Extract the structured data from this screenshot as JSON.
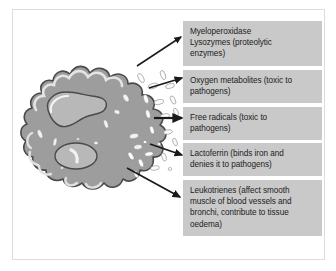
{
  "figure": {
    "border_color": "#dcdcdc",
    "background_color": "#ffffff"
  },
  "cell": {
    "name": "neutrophil",
    "body_color": "#9d9d9d",
    "outline_color": "#4d4d4d",
    "nucleus_color": "#b5b5b5",
    "granule_color": "#f2f2f2",
    "highlight_color": "#e8e8e8"
  },
  "arrows": {
    "color": "#1a1a1a",
    "count": 5
  },
  "labels": [
    {
      "id": "myeloperoxidase",
      "lines": [
        "Myeloperoxidase",
        "Lysozymes (proteolytic",
        "enzymes)"
      ]
    },
    {
      "id": "oxygen-metabolites",
      "lines": [
        "Oxygen metabolites (toxic to",
        "pathogens)"
      ]
    },
    {
      "id": "free-radicals",
      "lines": [
        "Free radicals (toxic to",
        "pathogens)"
      ]
    },
    {
      "id": "lactoferrin",
      "lines": [
        "Lactoferrin (binds iron and",
        "denies it to pathogens)"
      ]
    },
    {
      "id": "leukotrienes",
      "lines": [
        "Leukotrienes (affect smooth",
        "muscle of blood vessels and",
        "bronchi, contribute to tissue",
        "oedema)"
      ]
    }
  ]
}
